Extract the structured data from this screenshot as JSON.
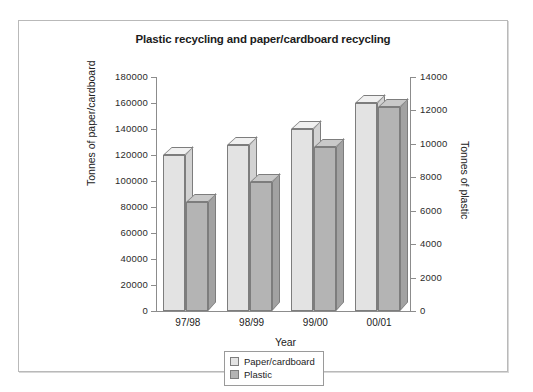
{
  "chart_data": {
    "type": "bar",
    "title": "Plastic recycling and paper/cardboard recycling",
    "xlabel": "Year",
    "categories": [
      "97/98",
      "98/99",
      "99/00",
      "00/01"
    ],
    "grid": false,
    "legend_position": "bottom-center",
    "axes": {
      "left": {
        "label": "Tonnes of paper/cardboard",
        "min": 0,
        "max": 180000,
        "step": 20000,
        "ticks": [
          "0",
          "20000",
          "40000",
          "60000",
          "80000",
          "100000",
          "120000",
          "140000",
          "160000",
          "180000"
        ]
      },
      "right": {
        "label": "Tonnes of plastic",
        "min": 0,
        "max": 14000,
        "step": 2000,
        "ticks": [
          "0",
          "2000",
          "4000",
          "6000",
          "8000",
          "10000",
          "12000",
          "14000"
        ]
      }
    },
    "series": [
      {
        "name": "Paper/cardboard",
        "axis": "left",
        "color": "#e3e3e3",
        "values": [
          120000,
          128000,
          140000,
          160000
        ]
      },
      {
        "name": "Plastic",
        "axis": "right",
        "color": "#b4b4b4",
        "values": [
          6500,
          7700,
          9800,
          12200
        ]
      }
    ]
  }
}
